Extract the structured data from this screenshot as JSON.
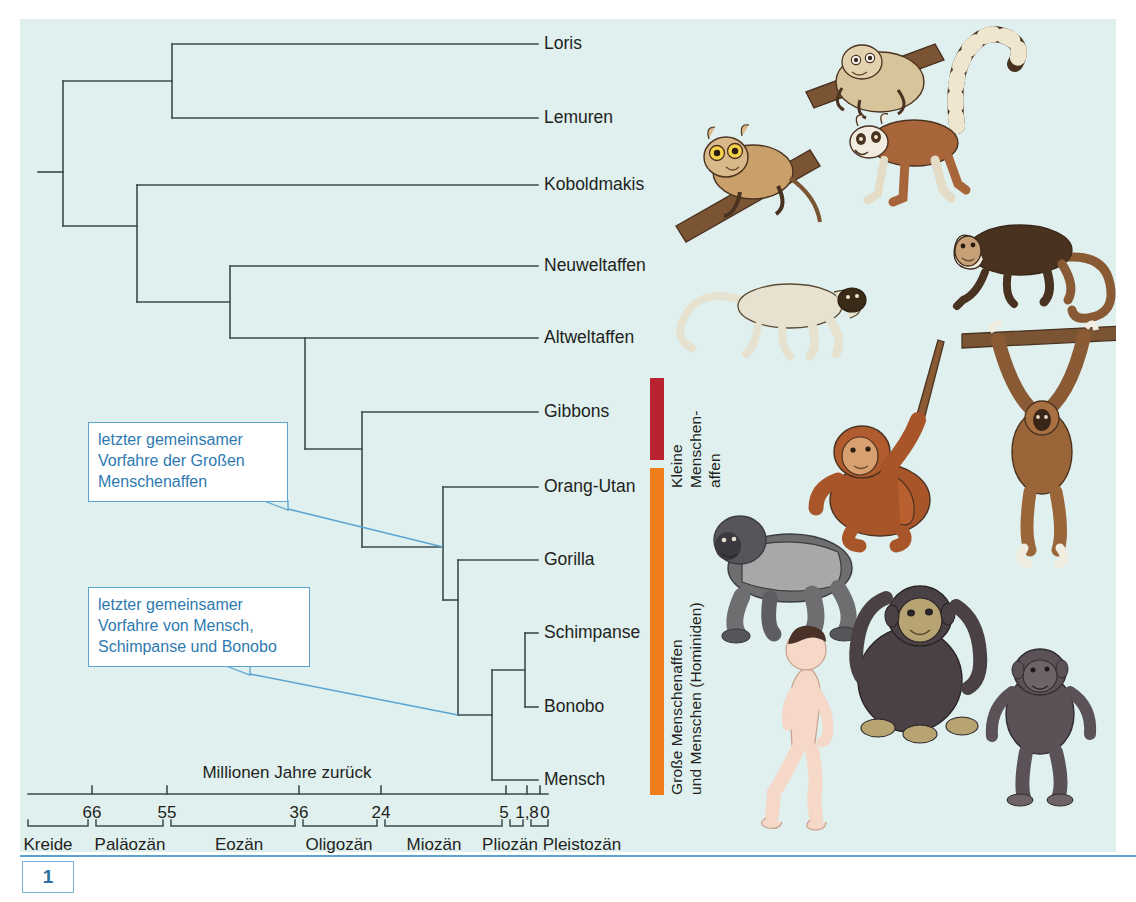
{
  "figure": {
    "number": "1",
    "background_color": "#dff0ef",
    "accent_blue": "#5ba3d0"
  },
  "tree": {
    "tips": [
      {
        "name": "Loris",
        "label": "Loris",
        "y": 44,
        "branch_x": 172
      },
      {
        "name": "Lemuren",
        "label": "Lemuren",
        "y": 118,
        "branch_x": 172
      },
      {
        "name": "Koboldmakis",
        "label": "Koboldmakis",
        "y": 185,
        "branch_x": 137
      },
      {
        "name": "Neuweltaffen",
        "label": "Neuweltaffen",
        "y": 266,
        "branch_x": 230
      },
      {
        "name": "Altweltaffen",
        "label": "Altweltaffen",
        "y": 338,
        "branch_x": 305
      },
      {
        "name": "Gibbons",
        "label": "Gibbons",
        "y": 412,
        "branch_x": 362
      },
      {
        "name": "Orang-Utan",
        "label": "Orang-Utan",
        "y": 487,
        "branch_x": 443
      },
      {
        "name": "Gorilla",
        "label": "Gorilla",
        "y": 560,
        "branch_x": 458
      },
      {
        "name": "Schimpanse",
        "label": "Schimpanse",
        "y": 633,
        "branch_x": 525
      },
      {
        "name": "Bonobo",
        "label": "Bonobo",
        "y": 707,
        "branch_x": 525
      },
      {
        "name": "Mensch",
        "label": "Mensch",
        "y": 780,
        "branch_x": 492
      }
    ],
    "label_x": 544,
    "tip_line_end": 538,
    "root_stub_x": 38,
    "nodes": [
      {
        "name": "root",
        "x": 63,
        "y_top": 81,
        "y_bot": 226
      },
      {
        "name": "strepsirrhini",
        "x": 172,
        "y_top": 44,
        "y_bot": 118
      },
      {
        "name": "haplorhini",
        "x": 137,
        "y_top": 185,
        "y_bot": 302
      },
      {
        "name": "anthropoidea",
        "x": 230,
        "y_top": 266,
        "y_bot": 338
      },
      {
        "name": "catarrhini",
        "x": 305,
        "y_top": 338,
        "y_bot": 449
      },
      {
        "name": "hominoidea",
        "x": 362,
        "y_top": 412,
        "y_bot": 547
      },
      {
        "name": "hominidae",
        "x": 443,
        "y_top": 487,
        "y_bot": 600
      },
      {
        "name": "homininae",
        "x": 458,
        "y_top": 560,
        "y_bot": 715
      },
      {
        "name": "hominini",
        "x": 492,
        "y_top": 670,
        "y_bot": 780
      },
      {
        "name": "pan",
        "x": 525,
        "y_top": 633,
        "y_bot": 707
      }
    ]
  },
  "callouts": [
    {
      "name": "callout-great-apes",
      "text": "letzter gemeinsamer\nVorfahre der Großen\nMenschenaffen",
      "box": {
        "x": 88,
        "y": 422,
        "w": 200,
        "h": 80
      },
      "leader_from": {
        "x": 288,
        "y": 509
      },
      "leader_to": {
        "x": 443,
        "y": 547
      }
    },
    {
      "name": "callout-human-chimp-bonobo",
      "text": "letzter gemeinsamer\nVorfahre von Mensch,\nSchimpanse und Bonobo",
      "box": {
        "x": 88,
        "y": 587,
        "w": 222,
        "h": 80
      },
      "leader_from": {
        "x": 250,
        "y": 674
      },
      "leader_to": {
        "x": 458,
        "y": 715
      }
    }
  ],
  "group_bars": [
    {
      "name": "kleine-menschenaffen",
      "color": "#b8232f",
      "x": 650,
      "y": 378,
      "w": 14,
      "h": 82,
      "label": "Kleine\nMenschen-\naffen",
      "label_x": 672,
      "label_y": 378
    },
    {
      "name": "grosse-menschenaffen",
      "color": "#ef7d1a",
      "x": 650,
      "y": 468,
      "w": 14,
      "h": 327,
      "label": "Große Menschenaffen\nund Menschen (Hominiden)",
      "label_x": 672,
      "label_y": 583
    }
  ],
  "axis": {
    "title": "Millionen Jahre zurück",
    "title_x": 287,
    "title_y": 763,
    "line": {
      "x1": 28,
      "x2": 548,
      "y": 794
    },
    "ticks": [
      {
        "value": "66",
        "x": 92
      },
      {
        "value": "55",
        "x": 167
      },
      {
        "value": "36",
        "x": 299
      },
      {
        "value": "24",
        "x": 381
      },
      {
        "value": "5",
        "x": 506
      },
      {
        "value": "1,8",
        "x": 527
      },
      {
        "value": "0",
        "x": 540
      }
    ],
    "tick_label_y": 803,
    "epoch_axis_y": 826,
    "epochs": [
      {
        "label": "Kreide",
        "x1": 28,
        "x2": 92,
        "center": 48
      },
      {
        "label": "Paläozän",
        "x1": 92,
        "x2": 167,
        "center": 127
      },
      {
        "label": "Eozän",
        "x1": 167,
        "x2": 299,
        "center": 239
      },
      {
        "label": "Oligozän",
        "x1": 299,
        "x2": 381,
        "center": 339
      },
      {
        "label": "Miozän",
        "x1": 381,
        "x2": 506,
        "center": 434
      },
      {
        "label": "Pliozän",
        "x1": 506,
        "x2": 527,
        "center": 508
      },
      {
        "label": "Pleistozän",
        "x1": 527,
        "x2": 548,
        "center": 581
      }
    ],
    "epoch_label_y": 835
  },
  "illustrations": [
    {
      "name": "loris-on-branch",
      "x": 820,
      "y": 30
    },
    {
      "name": "lemur",
      "x": 840,
      "y": 30
    },
    {
      "name": "tarsier-koboldmaki",
      "x": 690,
      "y": 130
    },
    {
      "name": "capuchin-neuweltaffe",
      "x": 940,
      "y": 205
    },
    {
      "name": "langur-altweltaffe",
      "x": 680,
      "y": 270
    },
    {
      "name": "orangutan",
      "x": 840,
      "y": 330
    },
    {
      "name": "gibbon",
      "x": 955,
      "y": 315
    },
    {
      "name": "gorilla",
      "x": 725,
      "y": 495
    },
    {
      "name": "chimpanzee",
      "x": 865,
      "y": 565
    },
    {
      "name": "human",
      "x": 775,
      "y": 645
    },
    {
      "name": "bonobo",
      "x": 995,
      "y": 670
    }
  ]
}
